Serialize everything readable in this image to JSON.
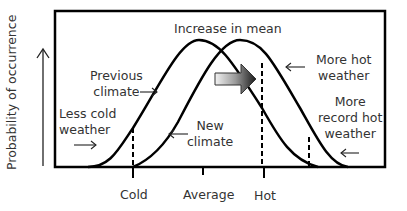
{
  "title": "Increase in mean",
  "y_axis": {
    "label": "Probability of occurrence"
  },
  "x_axis": {
    "ticks": [
      "Cold",
      "Average",
      "Hot"
    ]
  },
  "curves": [
    {
      "name": "Previous climate",
      "label": "Previous\nclimate"
    },
    {
      "name": "New climate",
      "label": "New\nclimate"
    }
  ],
  "annotations": {
    "less_cold_line1": "Less cold",
    "less_cold_line2": "weather",
    "previous_line1": "Previous",
    "previous_line2": "climate",
    "new_line1": "New",
    "new_line2": "climate",
    "more_hot_line1": "More hot",
    "more_hot_line2": "weather",
    "record_line1": "More",
    "record_line2": "record hot",
    "record_line3": "weather"
  },
  "colors": {
    "stroke": "#000000",
    "text": "#333333",
    "arrow_light": "#f0f0f0",
    "arrow_dark": "#1a1a1a"
  }
}
